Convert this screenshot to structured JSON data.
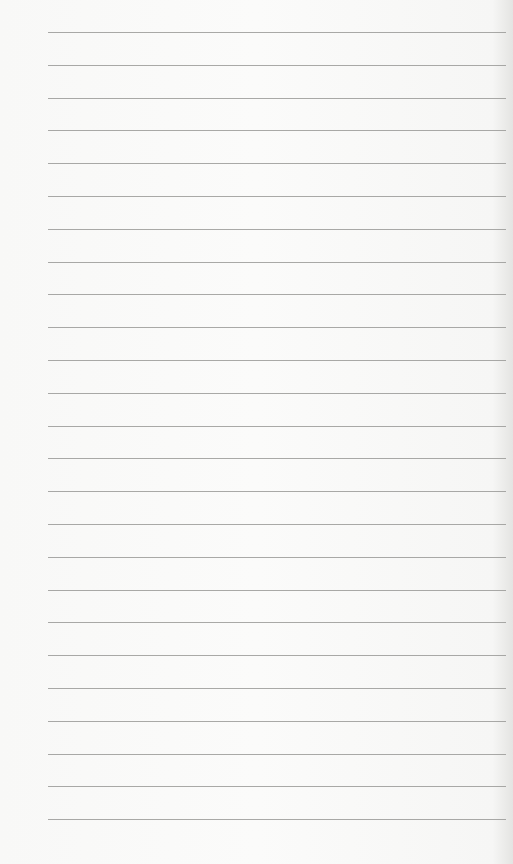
{
  "page": {
    "type": "lined-paper",
    "background_color": "#f8f8f7",
    "line_color": "#9a9a98",
    "line_count": 25,
    "line_spacing_px": 32.8,
    "first_line_y": 32,
    "line_left_x": 48,
    "line_right_x": 506
  }
}
